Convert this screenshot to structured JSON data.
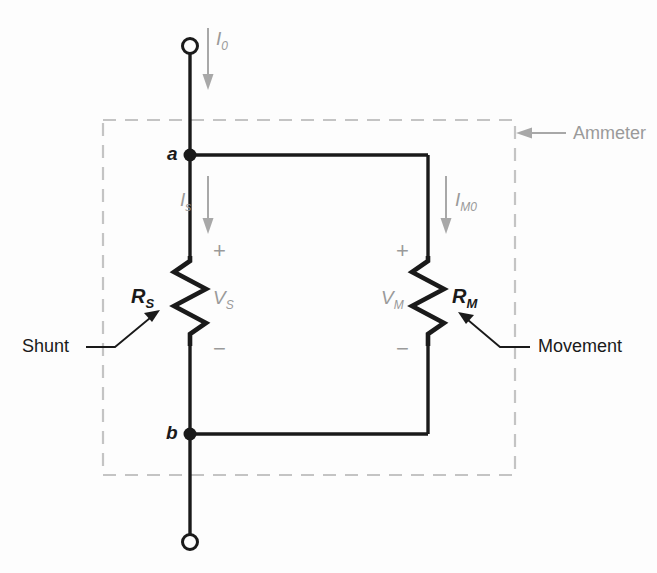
{
  "figure": {
    "background_color": "#fdfdfd",
    "wire_color": "#1a1a1a",
    "annotation_color": "#9a9a9a",
    "enclosure": {
      "label": "Ammeter",
      "style": "dashed-rectangle",
      "color": "#bdbdbd"
    },
    "nodes": [
      {
        "name": "a",
        "label": "a"
      },
      {
        "name": "b",
        "label": "b"
      }
    ],
    "terminals": [
      {
        "name": "top-terminal",
        "style": "open-circle"
      },
      {
        "name": "bottom-terminal",
        "style": "open-circle"
      }
    ],
    "components": [
      {
        "name": "shunt-resistor",
        "symbol": "zigzag-resistor",
        "label": "R",
        "label_sub": "S",
        "voltage_label": "V",
        "voltage_sub": "S",
        "plus_sign": "+",
        "minus_sign": "−",
        "callout": "Shunt"
      },
      {
        "name": "movement-resistor",
        "symbol": "zigzag-resistor",
        "label": "R",
        "label_sub": "M",
        "voltage_label": "V",
        "voltage_sub": "M",
        "plus_sign": "+",
        "minus_sign": "−",
        "callout": "Movement"
      }
    ],
    "currents": [
      {
        "name": "total-current",
        "label": "I",
        "sub": "0",
        "direction": "down"
      },
      {
        "name": "shunt-current",
        "label": "I",
        "sub": "s",
        "direction": "down"
      },
      {
        "name": "movement-current",
        "label": "I",
        "sub": "M0",
        "direction": "down"
      }
    ]
  }
}
